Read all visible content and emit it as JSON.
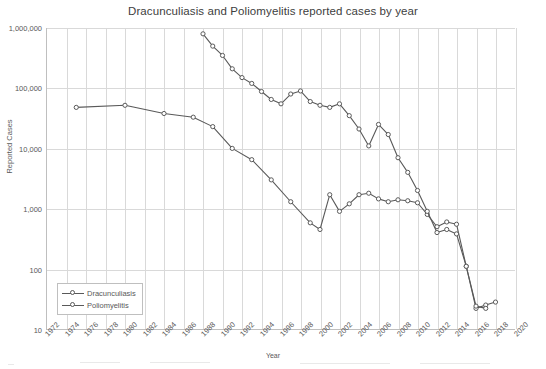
{
  "chart_data": {
    "type": "line",
    "title": "Dracunculiasis and Poliomyelitis reported cases by year",
    "xlabel": "Year",
    "ylabel": "Reported Cases",
    "yscale": "log",
    "ylim": [
      10,
      1000000
    ],
    "ytick_labels": [
      "1,000,000",
      "100,000",
      "10,000",
      "1,000",
      "100",
      "10"
    ],
    "ytick_values": [
      1000000,
      100000,
      10000,
      1000,
      100,
      10
    ],
    "xlim": [
      1972,
      2020
    ],
    "xtick_labels": [
      "1972",
      "1974",
      "1976",
      "1978",
      "1980",
      "1982",
      "1984",
      "1986",
      "1988",
      "1990",
      "1992",
      "1994",
      "1996",
      "1998",
      "2000",
      "2002",
      "2004",
      "2006",
      "2008",
      "2010",
      "2012",
      "2014",
      "2016",
      "2018",
      "2020"
    ],
    "grid": true,
    "legend_position": "bottom-left",
    "marker": "open-circle",
    "series": [
      {
        "name": "Dracunculiasis",
        "color": "#595959",
        "x": [
          1975,
          1980,
          1984,
          1987,
          1989,
          1991,
          1993,
          1995,
          1997,
          1999,
          2000,
          2001,
          2002,
          2003,
          2004,
          2005,
          2006,
          2007,
          2008,
          2009,
          2010,
          2011,
          2012,
          2013,
          2014,
          2015,
          2016,
          2017,
          2018
        ],
        "y": [
          48000,
          52000,
          38000,
          33000,
          23000,
          10000,
          6500,
          3000,
          1300,
          580,
          450,
          1700,
          900,
          1200,
          1700,
          1800,
          1450,
          1300,
          1400,
          1350,
          1250,
          800,
          500,
          600,
          550,
          110,
          22,
          25,
          28
        ]
      },
      {
        "name": "Poliomyelitis",
        "color": "#595959",
        "x": [
          1988,
          1989,
          1990,
          1991,
          1992,
          1993,
          1994,
          1995,
          1996,
          1997,
          1998,
          1999,
          2000,
          2001,
          2002,
          2003,
          2004,
          2005,
          2006,
          2007,
          2008,
          2009,
          2010,
          2011,
          2012,
          2013,
          2014,
          2015,
          2016,
          2017
        ],
        "y": [
          800000,
          500000,
          350000,
          210000,
          150000,
          120000,
          88000,
          65000,
          55000,
          80000,
          90000,
          60000,
          52000,
          48000,
          55000,
          35000,
          21000,
          11000,
          25000,
          17000,
          7000,
          4000,
          2000,
          900,
          400,
          450,
          380,
          110,
          24,
          22
        ]
      }
    ]
  }
}
